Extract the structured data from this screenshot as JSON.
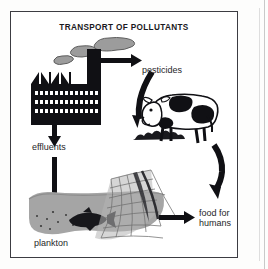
{
  "figure": {
    "title": "TRANSPORT OF POLLUTANTS",
    "type": "diagram",
    "frame": {
      "border_color": "#3c3c42",
      "background": "#ffffff"
    },
    "palette": {
      "ink": "#19191d",
      "label_text": "#262629",
      "smoke_gray": "#9a9a9a",
      "smoke_outline": "#5a5a5a",
      "water_gray": "#a3a3a3",
      "net_gray": "#8e8e8e",
      "page_edge": "#c9c9c9"
    },
    "labels": {
      "pesticides": "pesticides",
      "effluents": "effluents",
      "plankton": "plankton",
      "food_for_humans": "food for\nhumans"
    },
    "nodes": [
      {
        "id": "factory",
        "name": "factory",
        "description": "black silhouette factory with sawtooth roof, tall chimney and three rows of windows"
      },
      {
        "id": "smoke",
        "name": "smoke-plume",
        "description": "three gray smoke puffs rising from the chimney"
      },
      {
        "id": "pesticides",
        "name": "pesticides",
        "description": "airborne pesticides label"
      },
      {
        "id": "cow",
        "name": "cow",
        "description": "black and white Holstein cow grazing on ground"
      },
      {
        "id": "effluents",
        "name": "effluents",
        "description": "liquid waste discharged from factory"
      },
      {
        "id": "water",
        "name": "water-body",
        "description": "gray water body containing plankton dots and a fish"
      },
      {
        "id": "fish",
        "name": "fish",
        "description": "dark fish swimming in the water"
      },
      {
        "id": "plankton",
        "name": "plankton",
        "description": "small dots representing plankton in water"
      },
      {
        "id": "net",
        "name": "fishing-net",
        "description": "mesh trawl fishing net dipped in the water"
      },
      {
        "id": "food",
        "name": "food-for-humans",
        "description": "end of the chain: food for humans"
      }
    ],
    "arrows": [
      {
        "id": "chimney-to-pesticides",
        "from": "factory",
        "to": "pesticides",
        "style": "straight-right",
        "shape": "horizontal thick arrow"
      },
      {
        "id": "pesticides-to-cow",
        "from": "pesticides",
        "to": "cow",
        "style": "curved-down",
        "shape": "thick curved arrow bending left then down"
      },
      {
        "id": "factory-to-effluents",
        "from": "factory",
        "to": "effluents",
        "style": "straight-down",
        "shape": "vertical thick arrow"
      },
      {
        "id": "effluents-to-water",
        "from": "effluents",
        "to": "water",
        "style": "straight-down",
        "shape": "vertical thick arrow into the water"
      },
      {
        "id": "cow-to-food",
        "from": "cow",
        "to": "food",
        "style": "curved-down",
        "shape": "thick curved arrow descending right side"
      },
      {
        "id": "net-to-food",
        "from": "net",
        "to": "food",
        "style": "straight-right",
        "shape": "horizontal thick arrow"
      }
    ]
  }
}
